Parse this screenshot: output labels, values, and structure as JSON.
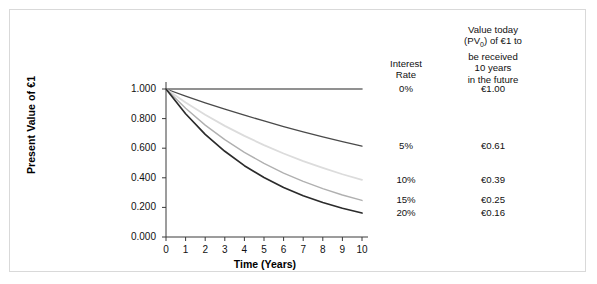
{
  "figure": {
    "background_color": "#ffffff",
    "frame_color": "#d9d9d9"
  },
  "chart_data": {
    "type": "line",
    "title": "",
    "xlabel": "Time (Years)",
    "ylabel": "Present Value of €1",
    "xlim": [
      0,
      10
    ],
    "ylim": [
      0.0,
      1.0
    ],
    "grid": false,
    "legend_position": "right",
    "x": [
      0,
      1,
      2,
      3,
      4,
      5,
      6,
      7,
      8,
      9,
      10
    ],
    "xticks": [
      "0",
      "1",
      "2",
      "3",
      "4",
      "5",
      "6",
      "7",
      "8",
      "9",
      "10"
    ],
    "yticks": [
      "0.000",
      "0.200",
      "0.400",
      "0.600",
      "0.800",
      "1.000"
    ],
    "ytick_values": [
      0.0,
      0.2,
      0.4,
      0.6,
      0.8,
      1.0
    ],
    "series": [
      {
        "name": "0%",
        "rate": 0.0,
        "color": "#6e6e6e",
        "width": 1.6,
        "end_value": "€1.00",
        "values": [
          1.0,
          1.0,
          1.0,
          1.0,
          1.0,
          1.0,
          1.0,
          1.0,
          1.0,
          1.0,
          1.0
        ]
      },
      {
        "name": "5%",
        "rate": 0.05,
        "color": "#4a4a4a",
        "width": 1.3,
        "end_value": "€0.61",
        "values": [
          1.0,
          0.952,
          0.907,
          0.864,
          0.823,
          0.784,
          0.746,
          0.711,
          0.677,
          0.645,
          0.614
        ]
      },
      {
        "name": "10%",
        "rate": 0.1,
        "color": "#dcdcdc",
        "width": 1.8,
        "end_value": "€0.39",
        "values": [
          1.0,
          0.909,
          0.826,
          0.751,
          0.683,
          0.621,
          0.564,
          0.513,
          0.467,
          0.424,
          0.386
        ]
      },
      {
        "name": "15%",
        "rate": 0.15,
        "color": "#b0b0b0",
        "width": 1.4,
        "end_value": "€0.25",
        "values": [
          1.0,
          0.87,
          0.756,
          0.658,
          0.572,
          0.497,
          0.432,
          0.376,
          0.327,
          0.284,
          0.247
        ]
      },
      {
        "name": "20%",
        "rate": 0.2,
        "color": "#2b2b2b",
        "width": 1.7,
        "end_value": "€0.16",
        "values": [
          1.0,
          0.833,
          0.694,
          0.579,
          0.482,
          0.402,
          0.335,
          0.279,
          0.233,
          0.194,
          0.162
        ]
      }
    ]
  },
  "legend": {
    "header_rate": "Interest\nRate",
    "header_rate_line1": "Interest",
    "header_rate_line2": "Rate",
    "header_value_line1": "Value today",
    "header_value_line2_a": "(PV",
    "header_value_line2_sub": "0",
    "header_value_line2_b": ") of €1 to",
    "header_value_line3": "be received",
    "header_value_line4": "10 years",
    "header_value_line5": "in the future",
    "rows": [
      {
        "rate": "0%",
        "value": "€1.00"
      },
      {
        "rate": "5%",
        "value": "€0.61"
      },
      {
        "rate": "10%",
        "value": "€0.39"
      },
      {
        "rate": "15%",
        "value": "€0.25"
      },
      {
        "rate": "20%",
        "value": "€0.16"
      }
    ]
  }
}
